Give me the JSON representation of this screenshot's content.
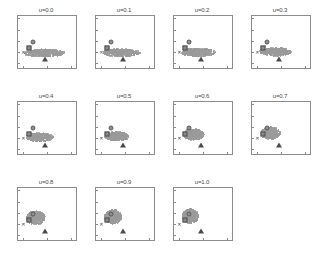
{
  "figure": {
    "layout": {
      "rows": 3,
      "cols": 4,
      "panel_count": 11
    },
    "axis": {
      "xlim": [
        -1,
        11
      ],
      "ylim": [
        -7,
        16
      ],
      "xticks": [
        "0",
        "5",
        "10"
      ],
      "xtick_values": [
        0,
        5,
        10
      ],
      "yticks": [
        "15",
        "10",
        "5",
        "0",
        "-5"
      ],
      "ytick_values": [
        15,
        10,
        5,
        0,
        -5
      ]
    },
    "colors": {
      "cloud": "#a6a6a6",
      "marker_outline": "#4f4f4f",
      "axis": "#8c8c8c",
      "text": "#4a4a4a"
    }
  },
  "chart_data": {
    "type": "scatter",
    "title": "",
    "xlabel": "",
    "ylabel": "",
    "xlim": [
      -1,
      11
    ],
    "ylim": [
      -7,
      16
    ],
    "grid": false,
    "legend": null,
    "panel_parameter": "u",
    "shared_markers": [
      {
        "name": "circle-marker",
        "shape": "circle",
        "x": 2.0,
        "y": 4.6
      },
      {
        "name": "square-marker",
        "shape": "square",
        "x": 1.3,
        "y": 1.9
      },
      {
        "name": "x-marker",
        "shape": "x",
        "x": 0.1,
        "y": 0.2
      },
      {
        "name": "triangle-marker",
        "shape": "triangle-up",
        "x": 4.6,
        "y": -2.8
      }
    ],
    "panels": [
      {
        "label": "u=0.0",
        "u": 0.0,
        "cloud": {
          "cx": 4.3,
          "cy": 0.0,
          "rx": 4.2,
          "ry": 1.7
        }
      },
      {
        "label": "u=0.1",
        "u": 0.1,
        "cloud": {
          "cx": 4.1,
          "cy": 0.1,
          "rx": 3.9,
          "ry": 1.7
        }
      },
      {
        "label": "u=0.2",
        "u": 0.2,
        "cloud": {
          "cx": 3.9,
          "cy": 0.3,
          "rx": 3.6,
          "ry": 1.8
        }
      },
      {
        "label": "u=0.3",
        "u": 0.3,
        "cloud": {
          "cx": 3.7,
          "cy": 0.5,
          "rx": 3.3,
          "ry": 1.8
        }
      },
      {
        "label": "u=0.4",
        "u": 0.4,
        "cloud": {
          "cx": 3.3,
          "cy": 0.8,
          "rx": 2.8,
          "ry": 1.9
        }
      },
      {
        "label": "u=0.5",
        "u": 0.5,
        "cloud": {
          "cx": 3.1,
          "cy": 1.2,
          "rx": 2.5,
          "ry": 2.0
        }
      },
      {
        "label": "u=0.6",
        "u": 0.6,
        "cloud": {
          "cx": 2.9,
          "cy": 2.0,
          "rx": 2.2,
          "ry": 2.4
        }
      },
      {
        "label": "u=0.7",
        "u": 0.7,
        "cloud": {
          "cx": 2.7,
          "cy": 2.6,
          "rx": 2.0,
          "ry": 2.7
        }
      },
      {
        "label": "u=0.8",
        "u": 0.8,
        "cloud": {
          "cx": 2.5,
          "cy": 3.2,
          "rx": 1.9,
          "ry": 3.0
        }
      },
      {
        "label": "u=0.9",
        "u": 0.9,
        "cloud": {
          "cx": 2.4,
          "cy": 3.6,
          "rx": 1.8,
          "ry": 3.1
        }
      },
      {
        "label": "u=1.0",
        "u": 1.0,
        "cloud": {
          "cx": 2.2,
          "cy": 4.0,
          "rx": 1.7,
          "ry": 3.2
        }
      }
    ]
  }
}
